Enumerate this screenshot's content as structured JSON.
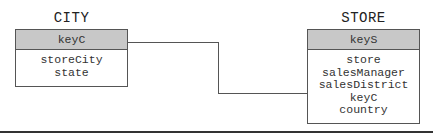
{
  "diagram": {
    "entities": [
      {
        "name": "CITY",
        "key": "keyC",
        "attributes": [
          "storeCity",
          "state"
        ]
      },
      {
        "name": "STORE",
        "key": "keyS",
        "attributes": [
          "store",
          "salesManager",
          "salesDistrict",
          "keyC",
          "country"
        ]
      }
    ],
    "relationships": [
      {
        "from": "CITY.keyC",
        "to": "STORE.keyC"
      }
    ],
    "colors": {
      "header_fill": "#c8c8c8",
      "border": "#555555"
    }
  }
}
